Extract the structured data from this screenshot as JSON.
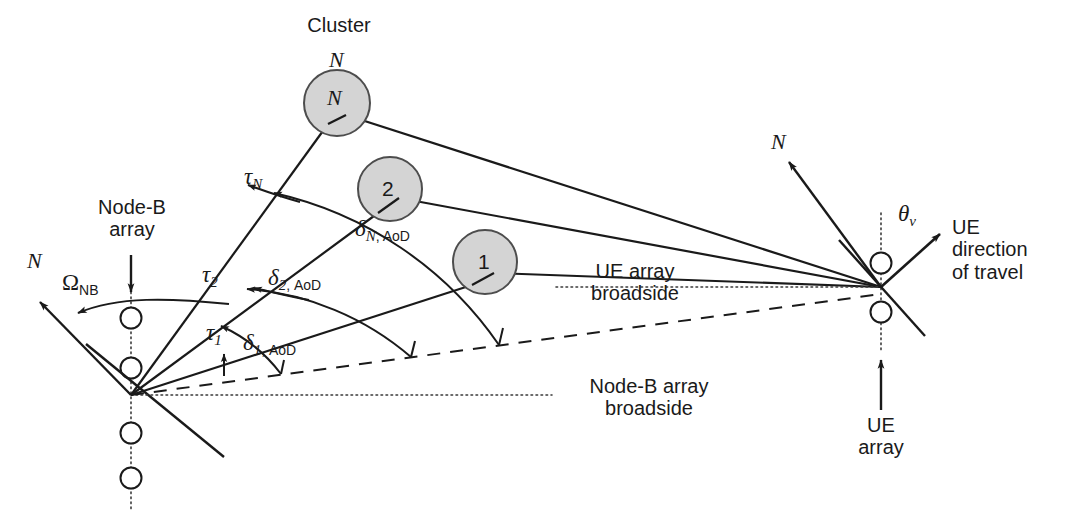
{
  "figure": {
    "type": "mimo-channel-geometry-diagram"
  },
  "colors": {
    "line": "#1a1a1a",
    "text": "#1a1a1a",
    "cluster_fill": "#d4d4d4",
    "cluster_stroke": "#4d4d4d",
    "dotted": "#3a3a3a"
  },
  "labels": {
    "cluster": "Cluster",
    "cluster_n_above": "N",
    "node_b_array": "Node-B\narray",
    "node_b_array_line1": "Node-B",
    "node_b_array_line2": "array",
    "ue_array_line1": "UE",
    "ue_array_line2": "array",
    "ue_direction_line1": "UE",
    "ue_direction_line2": "direction",
    "ue_direction_line3": "of travel",
    "ue_broadside_line1": "UE array",
    "ue_broadside_line2": "broadside",
    "nodeb_broadside_line1": "Node-B array",
    "nodeb_broadside_line2": "broadside",
    "north_nodeb": "N",
    "north_ue": "N"
  },
  "clusters": [
    {
      "id": "N",
      "label": "N",
      "cx": 337,
      "cy": 103,
      "r": 33
    },
    {
      "id": "2",
      "label": "2",
      "cx": 390,
      "cy": 189,
      "r": 32
    },
    {
      "id": "1",
      "label": "1",
      "cx": 485,
      "cy": 262,
      "r": 32
    }
  ],
  "symbols": {
    "omega_nb": {
      "greek": "Ω",
      "sub": "NB"
    },
    "tau_n": {
      "greek": "τ",
      "sub": "N"
    },
    "tau_2": {
      "greek": "τ",
      "sub": "2"
    },
    "tau_1": {
      "greek": "τ",
      "sub": "1"
    },
    "delta_n_aod": {
      "greek": "δ",
      "sub_it": "N",
      "sub_up": ", AoD"
    },
    "delta_2_aod": {
      "greek": "δ",
      "sub_it": "2",
      "sub_up": ", AoD"
    },
    "delta_1_aod": {
      "greek": "δ",
      "sub_it": "1",
      "sub_up": ", AoD"
    },
    "theta_v": {
      "greek": "θ",
      "sub_it": "v"
    }
  },
  "geometry": {
    "nodeb_vertex": {
      "x": 131,
      "y": 395
    },
    "ue_vertex": {
      "x": 881,
      "y": 287
    },
    "nodeb_array_elements_y": [
      318,
      368,
      433,
      478
    ],
    "ue_array_elements_y": [
      263,
      312
    ],
    "nodeb_north_tip": {
      "x": 34,
      "y": 297
    },
    "ue_north_tip": {
      "x": 783,
      "y": 156
    },
    "ue_travel_tip": {
      "x": 945,
      "y": 229
    }
  }
}
